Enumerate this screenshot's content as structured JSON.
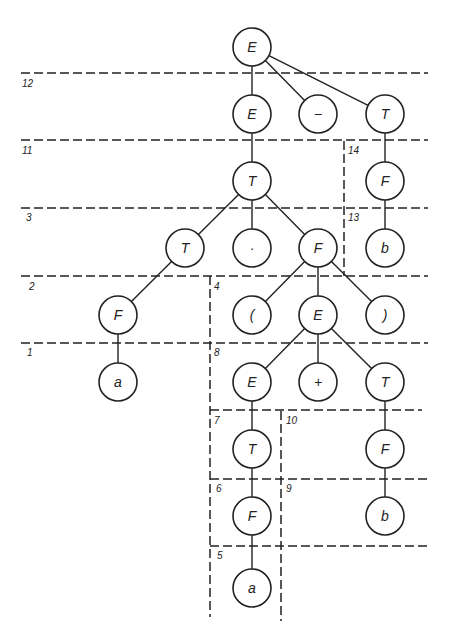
{
  "diagram": {
    "type": "parse-tree",
    "colors": {
      "stroke": "#222222",
      "background": "#ffffff"
    },
    "nodes": [
      {
        "id": "n1",
        "label": "E",
        "x": 252,
        "y": 47
      },
      {
        "id": "n2",
        "label": "E",
        "x": 252,
        "y": 114
      },
      {
        "id": "n3",
        "label": "−",
        "x": 318,
        "y": 114
      },
      {
        "id": "n4",
        "label": "T",
        "x": 385,
        "y": 114
      },
      {
        "id": "n5",
        "label": "T",
        "x": 252,
        "y": 181
      },
      {
        "id": "n6",
        "label": "F",
        "x": 385,
        "y": 181
      },
      {
        "id": "n7",
        "label": "T",
        "x": 185,
        "y": 248
      },
      {
        "id": "n8",
        "label": "·",
        "x": 252,
        "y": 248
      },
      {
        "id": "n9",
        "label": "F",
        "x": 318,
        "y": 248
      },
      {
        "id": "n10",
        "label": "b",
        "x": 385,
        "y": 248
      },
      {
        "id": "n11",
        "label": "F",
        "x": 118,
        "y": 315
      },
      {
        "id": "n12",
        "label": "(",
        "x": 252,
        "y": 315
      },
      {
        "id": "n13",
        "label": "E",
        "x": 318,
        "y": 315
      },
      {
        "id": "n14",
        "label": ")",
        "x": 385,
        "y": 315
      },
      {
        "id": "n15",
        "label": "a",
        "x": 118,
        "y": 382
      },
      {
        "id": "n16",
        "label": "E",
        "x": 252,
        "y": 382
      },
      {
        "id": "n17",
        "label": "+",
        "x": 318,
        "y": 382
      },
      {
        "id": "n18",
        "label": "T",
        "x": 385,
        "y": 382
      },
      {
        "id": "n19",
        "label": "T",
        "x": 252,
        "y": 449
      },
      {
        "id": "n20",
        "label": "F",
        "x": 385,
        "y": 449
      },
      {
        "id": "n21",
        "label": "F",
        "x": 252,
        "y": 516
      },
      {
        "id": "n22",
        "label": "b",
        "x": 385,
        "y": 516
      },
      {
        "id": "n23",
        "label": "a",
        "x": 252,
        "y": 588
      }
    ],
    "edges": [
      [
        "n1",
        "n2"
      ],
      [
        "n1",
        "n3"
      ],
      [
        "n1",
        "n4"
      ],
      [
        "n2",
        "n5"
      ],
      [
        "n4",
        "n6"
      ],
      [
        "n5",
        "n7"
      ],
      [
        "n5",
        "n8"
      ],
      [
        "n5",
        "n9"
      ],
      [
        "n6",
        "n10"
      ],
      [
        "n7",
        "n11"
      ],
      [
        "n9",
        "n12"
      ],
      [
        "n9",
        "n13"
      ],
      [
        "n9",
        "n14"
      ],
      [
        "n11",
        "n15"
      ],
      [
        "n13",
        "n16"
      ],
      [
        "n13",
        "n17"
      ],
      [
        "n13",
        "n18"
      ],
      [
        "n16",
        "n19"
      ],
      [
        "n18",
        "n20"
      ],
      [
        "n19",
        "n21"
      ],
      [
        "n20",
        "n22"
      ],
      [
        "n21",
        "n23"
      ]
    ],
    "dashed_lines": [
      {
        "x1": 21,
        "y1": 73,
        "x2": 428,
        "y2": 73
      },
      {
        "x1": 21,
        "y1": 140,
        "x2": 428,
        "y2": 140
      },
      {
        "x1": 21,
        "y1": 208,
        "x2": 428,
        "y2": 208
      },
      {
        "x1": 21,
        "y1": 276,
        "x2": 428,
        "y2": 276
      },
      {
        "x1": 21,
        "y1": 343,
        "x2": 428,
        "y2": 343
      },
      {
        "x1": 210,
        "y1": 410,
        "x2": 422,
        "y2": 410
      },
      {
        "x1": 210,
        "y1": 479,
        "x2": 428,
        "y2": 479
      },
      {
        "x1": 210,
        "y1": 546,
        "x2": 428,
        "y2": 546
      },
      {
        "x1": 344,
        "y1": 141,
        "x2": 344,
        "y2": 276
      },
      {
        "x1": 210,
        "y1": 276,
        "x2": 210,
        "y2": 617
      },
      {
        "x1": 281,
        "y1": 411,
        "x2": 281,
        "y2": 621
      }
    ],
    "zone_labels": [
      {
        "text": "12",
        "x": 22,
        "y": 78
      },
      {
        "text": "11",
        "x": 22,
        "y": 145
      },
      {
        "text": "3",
        "x": 26,
        "y": 212
      },
      {
        "text": "2",
        "x": 29,
        "y": 281
      },
      {
        "text": "1",
        "x": 27,
        "y": 347
      },
      {
        "text": "14",
        "x": 348,
        "y": 145
      },
      {
        "text": "13",
        "x": 348,
        "y": 212
      },
      {
        "text": "4",
        "x": 214,
        "y": 281
      },
      {
        "text": "8",
        "x": 214,
        "y": 347
      },
      {
        "text": "7",
        "x": 214,
        "y": 415
      },
      {
        "text": "10",
        "x": 286,
        "y": 415
      },
      {
        "text": "6",
        "x": 216,
        "y": 483
      },
      {
        "text": "9",
        "x": 286,
        "y": 483
      },
      {
        "text": "5",
        "x": 217,
        "y": 550
      }
    ]
  }
}
